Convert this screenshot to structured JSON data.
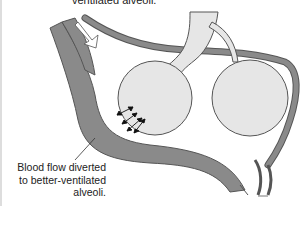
{
  "diagram": {
    "top_label": "ventilated alveoli.",
    "bottom_label_lines": [
      "Blood flow diverted",
      "to better-ventilated",
      "alveoli."
    ],
    "colors": {
      "vessel": "#8a8a8a",
      "vessel_outline": "#555555",
      "alveolus": "#e6e6e6",
      "airway": "#e6e6e6",
      "background": "#ffffff"
    },
    "elements": [
      {
        "name": "left-alveolus",
        "type": "alveolus"
      },
      {
        "name": "right-alveolus",
        "type": "alveolus"
      },
      {
        "name": "bronchiole",
        "type": "airway"
      },
      {
        "name": "arteriole",
        "type": "vessel"
      },
      {
        "name": "capillary-loop",
        "type": "vessel"
      },
      {
        "name": "gas-exchange-arrows",
        "count": 4
      }
    ]
  }
}
